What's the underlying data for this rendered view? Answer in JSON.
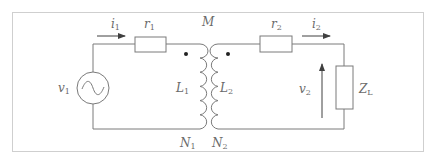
{
  "diagram": {
    "type": "transformer-circuit",
    "colors": {
      "wire": "#7a7a7a",
      "border": "#cfcfcf",
      "text": "#6a6a6a",
      "arrow": "#404040"
    },
    "labels": {
      "mutual": "M",
      "i1": {
        "main": "i",
        "sub": "1"
      },
      "r1": {
        "main": "r",
        "sub": "1"
      },
      "v1": {
        "main": "v",
        "sub": "1"
      },
      "L1": {
        "main": "L",
        "sub": "1"
      },
      "L2": {
        "main": "L",
        "sub": "2"
      },
      "N1": {
        "main": "N",
        "sub": "1"
      },
      "N2": {
        "main": "N",
        "sub": "2"
      },
      "r2": {
        "main": "r",
        "sub": "2"
      },
      "i2": {
        "main": "i",
        "sub": "2"
      },
      "v2": {
        "main": "v",
        "sub": "2"
      },
      "ZL": {
        "main": "Z",
        "sub": "L"
      }
    }
  }
}
